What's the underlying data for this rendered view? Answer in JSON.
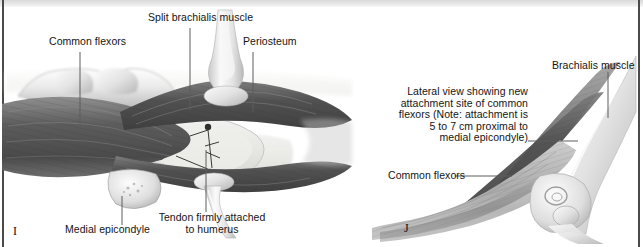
{
  "figure": {
    "style": "grayscale medical illustration",
    "background_color": "#ffffff",
    "border_color": "#4a4a4a",
    "label_color": "#141414",
    "leader_color": "#5d5d5d"
  },
  "panels": [
    {
      "letter": "I",
      "view": "anterior/medial exposure",
      "labels": {
        "common_flexors": "Common flexors",
        "split_brachialis": "Split brachialis muscle",
        "periosteum": "Periosteum",
        "medial_epicondyle": "Medial epicondyle",
        "tendon_attached": "Tendon firmly\nattached to humerus"
      }
    },
    {
      "letter": "J",
      "view": "lateral view",
      "labels": {
        "brachialis_muscle": "Brachialis muscle",
        "note": "Lateral view showing new attachment site of common flexors (Note: attachment is 5 to 7 cm proximal to medial epicondyle)",
        "common_flexors": "Common flexors"
      }
    }
  ]
}
